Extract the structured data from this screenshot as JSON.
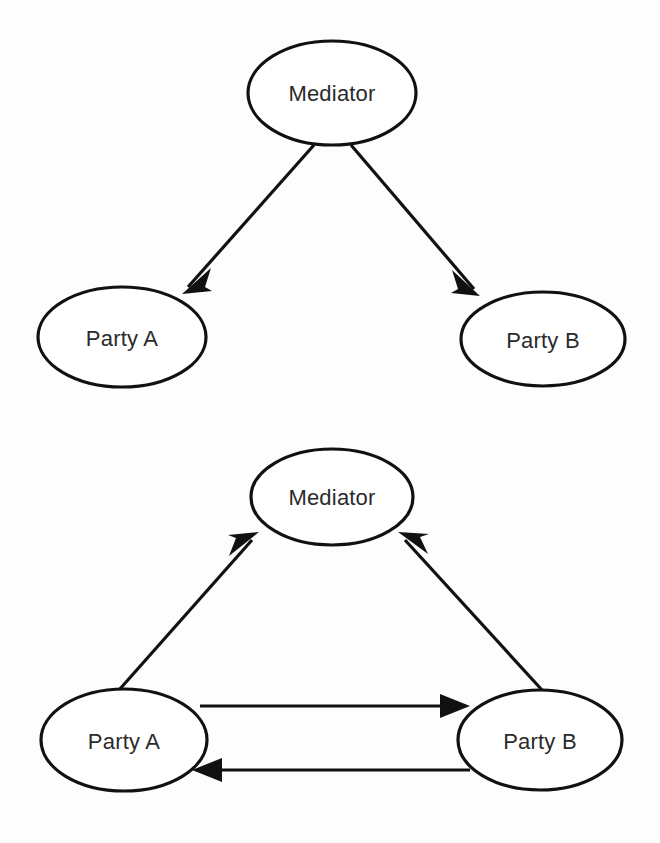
{
  "diagram": {
    "background_color": "#fdfdfd",
    "stroke_color": "#111111",
    "text_color": "#2b2b2b",
    "node_fill": "#ffffff",
    "panels": [
      {
        "id": "top-panel",
        "name": "one-way-mediation-diagram",
        "nodes": [
          {
            "id": "top-mediator",
            "label": "Mediator",
            "cx": 332,
            "cy": 93,
            "rx": 84,
            "ry": 52
          },
          {
            "id": "top-party-a",
            "label": "Party A",
            "cx": 122,
            "cy": 337,
            "rx": 84,
            "ry": 50
          },
          {
            "id": "top-party-b",
            "label": "Party B",
            "cx": 543,
            "cy": 339,
            "rx": 82,
            "ry": 47
          }
        ],
        "edges": [
          {
            "id": "top-edge-mediator-to-a",
            "from": "Mediator",
            "to": "Party A",
            "direction": "one-way",
            "arrow_at": "Party A"
          },
          {
            "id": "top-edge-mediator-to-b",
            "from": "Mediator",
            "to": "Party B",
            "direction": "one-way",
            "arrow_at": "Party B"
          }
        ]
      },
      {
        "id": "bottom-panel",
        "name": "triangular-mediation-diagram",
        "nodes": [
          {
            "id": "bottom-mediator",
            "label": "Mediator",
            "cx": 332,
            "cy": 497,
            "rx": 81,
            "ry": 48
          },
          {
            "id": "bottom-party-a",
            "label": "Party A",
            "cx": 124,
            "cy": 740,
            "rx": 83,
            "ry": 51
          },
          {
            "id": "bottom-party-b",
            "label": "Party B",
            "cx": 540,
            "cy": 740,
            "rx": 82,
            "ry": 50
          }
        ],
        "edges": [
          {
            "id": "bottom-edge-a-to-mediator",
            "from": "Party A",
            "to": "Mediator",
            "direction": "one-way",
            "arrow_at": "Mediator"
          },
          {
            "id": "bottom-edge-b-to-mediator",
            "from": "Party B",
            "to": "Mediator",
            "direction": "one-way",
            "arrow_at": "Mediator"
          },
          {
            "id": "bottom-edge-a-to-b",
            "from": "Party A",
            "to": "Party B",
            "direction": "one-way",
            "arrow_at": "Party B"
          },
          {
            "id": "bottom-edge-b-to-a",
            "from": "Party B",
            "to": "Party A",
            "direction": "one-way",
            "arrow_at": "Party A"
          }
        ]
      }
    ]
  },
  "labels": {
    "mediator_top": "Mediator",
    "party_a_top": "Party A",
    "party_b_top": "Party B",
    "mediator_bottom": "Mediator",
    "party_a_bottom": "Party A",
    "party_b_bottom": "Party B"
  }
}
